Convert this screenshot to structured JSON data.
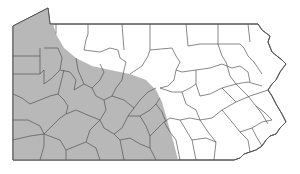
{
  "map": {
    "subject": "Pennsylvania counties",
    "shaded_region": "western and southwestern counties",
    "colors": {
      "background": "#ffffff",
      "shaded": "#b8b8b8",
      "unshaded": "#ffffff",
      "border": "#555555"
    }
  }
}
